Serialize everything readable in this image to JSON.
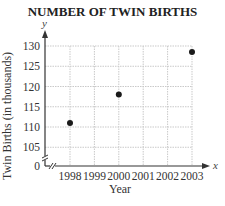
{
  "chart_data": {
    "type": "scatter",
    "title": "NUMBER OF TWIN BIRTHS",
    "xlabel": "Year",
    "ylabel": "Twin Births (in thousands)",
    "x_axis_var": "x",
    "y_axis_var": "y",
    "x": [
      1998,
      2000,
      2003
    ],
    "y": [
      111,
      118,
      128.5
    ],
    "x_ticks": [
      "1998",
      "1999",
      "2000",
      "2001",
      "2002",
      "2003"
    ],
    "y_ticks": [
      "0",
      "105",
      "110",
      "115",
      "120",
      "125",
      "130"
    ],
    "ylim": [
      105,
      130
    ],
    "xlim": [
      1997.1,
      2003.3
    ],
    "grid": true,
    "axis_break": "y-axis broken between 0 and 105",
    "legend": null
  }
}
